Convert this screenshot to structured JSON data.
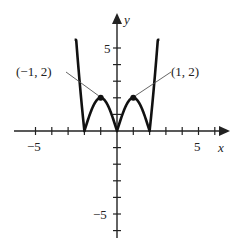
{
  "chart_data": {
    "type": "line",
    "title": "",
    "xlabel": "x",
    "ylabel": "y",
    "xlim": [
      -6,
      6
    ],
    "ylim": [
      -6,
      6
    ],
    "grid": false,
    "x_tick_labels": [
      "-5",
      "5"
    ],
    "y_tick_labels": [
      "5",
      "-5"
    ],
    "annotations": [
      {
        "label": "(−1, 2)",
        "x": -1,
        "y": 2
      },
      {
        "label": "(1, 2)",
        "x": 1,
        "y": 2
      }
    ],
    "key_points": [
      {
        "x": -2,
        "y": 0
      },
      {
        "x": -1,
        "y": 2
      },
      {
        "x": 0,
        "y": 0
      },
      {
        "x": 1,
        "y": 2
      },
      {
        "x": 2,
        "y": 0
      }
    ],
    "series": [
      {
        "name": "f(x)",
        "color": "#111111",
        "x": [
          -2.6,
          -2.3,
          -2.0,
          -1.5,
          -1.0,
          -0.5,
          0,
          0.5,
          1.0,
          1.5,
          2.0,
          2.3,
          2.6
        ],
        "y": [
          5.5,
          2.8,
          0,
          1.41,
          2,
          1.41,
          0,
          1.41,
          2,
          1.41,
          0,
          2.8,
          5.5
        ]
      }
    ]
  },
  "labels": {
    "x_axis": "x",
    "y_axis": "y",
    "x_neg5": "−5",
    "x_pos5": "5",
    "y_pos5": "5",
    "y_neg5": "−5",
    "point_left": "(−1, 2)",
    "point_right": "(1, 2)"
  }
}
